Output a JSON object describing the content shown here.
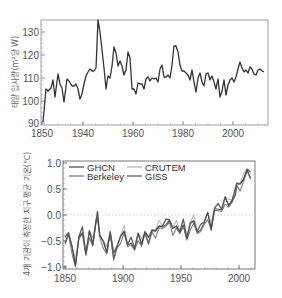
{
  "chart_data": [
    {
      "type": "line",
      "title": "",
      "xlabel": "",
      "ylabel": "태양 입사량(m²당 W)",
      "ylim": [
        90,
        135
      ],
      "yticks": [
        90,
        100,
        110,
        120,
        130
      ],
      "xtick_labels": [
        "1850",
        "1940",
        "1960",
        "1980",
        "2000"
      ],
      "grid": false,
      "legend": null,
      "series": [
        {
          "name": "Solar irradiance",
          "color": "#333333",
          "points": [
            [
              43,
              122
            ],
            [
              46,
              89
            ],
            [
              48,
              91
            ],
            [
              51,
              88
            ],
            [
              53,
              80
            ],
            [
              55,
              97
            ],
            [
              58,
              74
            ],
            [
              60,
              84
            ],
            [
              62,
              88
            ],
            [
              64,
              102
            ],
            [
              67,
              79
            ],
            [
              69,
              81
            ],
            [
              72,
              86
            ],
            [
              74,
              86
            ],
            [
              76,
              84
            ],
            [
              78,
              89
            ],
            [
              80,
              99
            ],
            [
              82,
              94
            ],
            [
              84,
              84
            ],
            [
              86,
              76
            ],
            [
              88,
              72
            ],
            [
              90,
              69
            ],
            [
              92,
              71
            ],
            [
              94,
              71
            ],
            [
              96,
              68
            ],
            [
              98,
              20
            ],
            [
              100,
              32
            ],
            [
              102,
              50
            ],
            [
              104,
              68
            ],
            [
              106,
              89
            ],
            [
              108,
              76
            ],
            [
              110,
              78
            ],
            [
              112,
              66
            ],
            [
              114,
              47
            ],
            [
              116,
              53
            ],
            [
              118,
              66
            ],
            [
              120,
              61
            ],
            [
              122,
              66
            ],
            [
              124,
              75
            ],
            [
              126,
              70
            ],
            [
              128,
              52
            ],
            [
              130,
              58
            ],
            [
              132,
              89
            ],
            [
              134,
              89
            ],
            [
              136,
              94
            ],
            [
              138,
              83
            ],
            [
              140,
              84
            ],
            [
              142,
              84
            ],
            [
              144,
              89
            ],
            [
              146,
              79
            ],
            [
              148,
              77
            ],
            [
              150,
              81
            ],
            [
              152,
              78
            ],
            [
              154,
              79
            ],
            [
              156,
              78
            ],
            [
              158,
              82
            ],
            [
              160,
              69
            ],
            [
              162,
              65
            ],
            [
              164,
              77
            ],
            [
              166,
              77
            ],
            [
              168,
              75
            ],
            [
              170,
              78
            ],
            [
              172,
              65
            ],
            [
              174,
              46
            ],
            [
              176,
              46
            ],
            [
              178,
              52
            ],
            [
              180,
              65
            ],
            [
              182,
              71
            ],
            [
              184,
              71
            ],
            [
              186,
              73
            ],
            [
              188,
              75
            ],
            [
              190,
              80
            ],
            [
              192,
              70
            ],
            [
              194,
              82
            ],
            [
              196,
              92
            ],
            [
              198,
              78
            ],
            [
              200,
              73
            ],
            [
              202,
              82
            ],
            [
              204,
              86
            ],
            [
              206,
              74
            ],
            [
              208,
              73
            ],
            [
              210,
              80
            ],
            [
              212,
              76
            ],
            [
              214,
              82
            ],
            [
              216,
              89
            ],
            [
              218,
              79
            ],
            [
              220,
              97
            ],
            [
              222,
              91
            ],
            [
              224,
              80
            ],
            [
              226,
              95
            ],
            [
              228,
              85
            ],
            [
              230,
              80
            ],
            [
              232,
              78
            ],
            [
              234,
              82
            ],
            [
              236,
              77
            ],
            [
              238,
              69
            ],
            [
              240,
              62
            ],
            [
              242,
              68
            ],
            [
              244,
              72
            ],
            [
              246,
              70
            ],
            [
              248,
              73
            ],
            [
              250,
              67
            ],
            [
              252,
              69
            ],
            [
              254,
              74
            ],
            [
              256,
              75
            ],
            [
              258,
              70
            ],
            [
              260,
              69
            ],
            [
              262,
              71
            ],
            [
              264,
              72
            ]
          ]
        }
      ]
    },
    {
      "type": "line",
      "title": "",
      "xlabel": "",
      "ylabel": "4개 기관이 측정한 지구 평균 기온(℃)",
      "ylim": [
        -1.0,
        1.0
      ],
      "yticks": [
        -1.0,
        -0.5,
        0.0,
        0.5,
        1.0
      ],
      "ytick_labels": [
        "−1.0",
        "−0.5",
        "0.0",
        "0.5",
        "1.0"
      ],
      "xlim": [
        1850,
        2012
      ],
      "xticks": [
        1850,
        1900,
        1950,
        2000
      ],
      "grid": false,
      "reference_line": 0.0,
      "legend_position": "upper left",
      "series": [
        {
          "name": "GHCN",
          "color": "#333333"
        },
        {
          "name": "CRUTEM",
          "color": "#aaaaaa"
        },
        {
          "name": "Berkeley",
          "color": "#666666"
        },
        {
          "name": "GISS",
          "color": "#444444"
        }
      ],
      "anomaly_by_year": {
        "years": [
          1850,
          1853,
          1856,
          1859,
          1862,
          1865,
          1868,
          1871,
          1874,
          1877,
          1878,
          1880,
          1883,
          1886,
          1889,
          1892,
          1895,
          1898,
          1901,
          1904,
          1907,
          1910,
          1913,
          1916,
          1919,
          1922,
          1925,
          1928,
          1931,
          1934,
          1937,
          1940,
          1943,
          1946,
          1949,
          1952,
          1955,
          1958,
          1961,
          1964,
          1967,
          1970,
          1973,
          1976,
          1979,
          1982,
          1985,
          1988,
          1991,
          1994,
          1997,
          1998,
          2001,
          2004,
          2007,
          2010
        ],
        "values": [
          -0.5,
          -0.35,
          -0.65,
          -0.95,
          -0.45,
          -0.3,
          -0.75,
          -0.35,
          -0.55,
          -0.1,
          0.0,
          -0.4,
          -0.55,
          -0.7,
          -0.35,
          -0.8,
          -0.6,
          -0.45,
          -0.3,
          -0.6,
          -0.5,
          -0.65,
          -0.4,
          -0.55,
          -0.35,
          -0.5,
          -0.3,
          -0.35,
          -0.2,
          -0.25,
          -0.15,
          -0.1,
          -0.3,
          -0.2,
          -0.35,
          -0.15,
          -0.45,
          -0.2,
          -0.1,
          -0.35,
          -0.25,
          -0.15,
          0.0,
          -0.25,
          0.1,
          0.15,
          0.1,
          0.3,
          0.2,
          0.25,
          0.45,
          0.6,
          0.55,
          0.7,
          0.85,
          0.75
        ]
      }
    }
  ],
  "top_chart": {
    "ylabel": "태양 입사량(m²당 W)",
    "yticks": [
      {
        "label": "130",
        "y": 32
      },
      {
        "label": "120",
        "y": 55
      },
      {
        "label": "110",
        "y": 78
      },
      {
        "label": "100",
        "y": 101
      },
      {
        "label": "90",
        "y": 123
      }
    ],
    "xticks": [
      {
        "label": "1850",
        "x": 42
      },
      {
        "label": "1940",
        "x": 83
      },
      {
        "label": "1960",
        "x": 133
      },
      {
        "label": "1980",
        "x": 183
      },
      {
        "label": "2000",
        "x": 233
      }
    ]
  },
  "bottom_chart": {
    "ylabel": "4개 기관이 측정한 지구 평균 기온(℃)",
    "yticks": [
      {
        "label": "1.0",
        "y": 163
      },
      {
        "label": "0.5",
        "y": 189
      },
      {
        "label": "0.0",
        "y": 215
      },
      {
        "label": "−0.5",
        "y": 241
      },
      {
        "label": "−1.0",
        "y": 267
      }
    ],
    "xticks": [
      {
        "label": "1850",
        "x": 65
      },
      {
        "label": "1900",
        "x": 123
      },
      {
        "label": "1950",
        "x": 181
      },
      {
        "label": "2000",
        "x": 239
      }
    ],
    "legend": {
      "ghcn": "GHCN",
      "crutem": "CRUTEM",
      "berkeley": "Berkeley",
      "giss": "GISS"
    }
  }
}
